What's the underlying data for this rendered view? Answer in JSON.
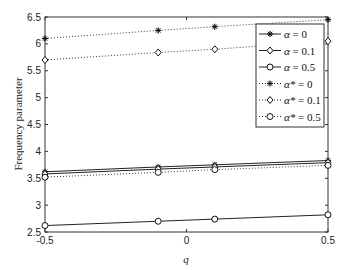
{
  "chart_data": {
    "type": "line",
    "title": "",
    "xlabel": "q",
    "ylabel": "Frequency parameter",
    "xlim": [
      -0.5,
      0.5
    ],
    "ylim": [
      2.5,
      6.5
    ],
    "grid": false,
    "legend_position": "upper right",
    "x": [
      -0.5,
      -0.1,
      0.1,
      0.5
    ],
    "x_ticks": [
      -0.5,
      0,
      0.5
    ],
    "x_tick_labels": [
      "-0.5",
      "0",
      "0.5"
    ],
    "y_ticks": [
      2.5,
      3,
      3.5,
      4,
      4.5,
      5,
      5.5,
      6,
      6.5
    ],
    "y_tick_labels": [
      "2.5",
      "3",
      "3.5",
      "4",
      "4.5",
      "5",
      "5.5",
      "6",
      "6.5"
    ],
    "series": [
      {
        "name": "α = 0",
        "label_sym": "α",
        "label_val": "= 0",
        "style": "solid",
        "marker": "asterisk",
        "values": [
          3.62,
          3.71,
          3.75,
          3.83
        ]
      },
      {
        "name": "α = 0.1",
        "label_sym": "α",
        "label_val": "= 0.1",
        "style": "solid",
        "marker": "diamond",
        "values": [
          3.58,
          3.67,
          3.71,
          3.79
        ]
      },
      {
        "name": "α = 0.5",
        "label_sym": "α",
        "label_val": "= 0.5",
        "style": "solid",
        "marker": "circle",
        "values": [
          2.62,
          2.7,
          2.74,
          2.82
        ]
      },
      {
        "name": "α* = 0",
        "label_sym": "α*",
        "label_val": "= 0",
        "style": "dotted",
        "marker": "asterisk",
        "values": [
          6.1,
          6.25,
          6.32,
          6.45
        ]
      },
      {
        "name": "α* = 0.1",
        "label_sym": "α*",
        "label_val": "= 0.1",
        "style": "dotted",
        "marker": "diamond",
        "values": [
          5.7,
          5.84,
          5.9,
          6.05
        ]
      },
      {
        "name": "α* = 0.5",
        "label_sym": "α*",
        "label_val": "= 0.5",
        "style": "dotted",
        "marker": "circle",
        "values": [
          3.52,
          3.61,
          3.66,
          3.74
        ]
      }
    ]
  }
}
